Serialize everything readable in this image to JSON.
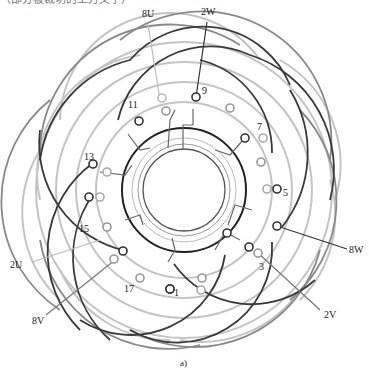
{
  "header_fragment": "（部分被裁切的上方文字）",
  "terminals": {
    "u_start": "8U",
    "u_end": "2U",
    "v_start": "8V",
    "v_end": "2V",
    "w_start": "8W",
    "w_end": "2W"
  },
  "slot_numbers": [
    "1",
    "3",
    "5",
    "7",
    "9",
    "11",
    "13",
    "15",
    "17"
  ],
  "caption": "a)",
  "colors": {
    "phase_dark": "#333333",
    "phase_mid": "#777777",
    "phase_light": "#bbbbbb",
    "background": "#ffffff"
  }
}
